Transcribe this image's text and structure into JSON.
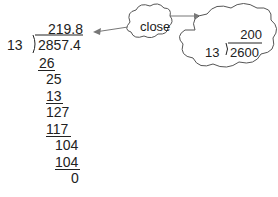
{
  "long_division": {
    "divisor": "13",
    "dividend": "2857.4",
    "quotient": "219.8",
    "steps": [
      "26",
      "25",
      "13",
      "127",
      "117",
      "104",
      "104",
      "0"
    ]
  },
  "callouts": {
    "label_bubble": "close",
    "estimate": {
      "divisor": "13",
      "dividend": "2600",
      "quotient": "200"
    }
  },
  "colors": {
    "ink": "#222222",
    "arrow": "#777777",
    "cloud_stroke": "#555555"
  }
}
